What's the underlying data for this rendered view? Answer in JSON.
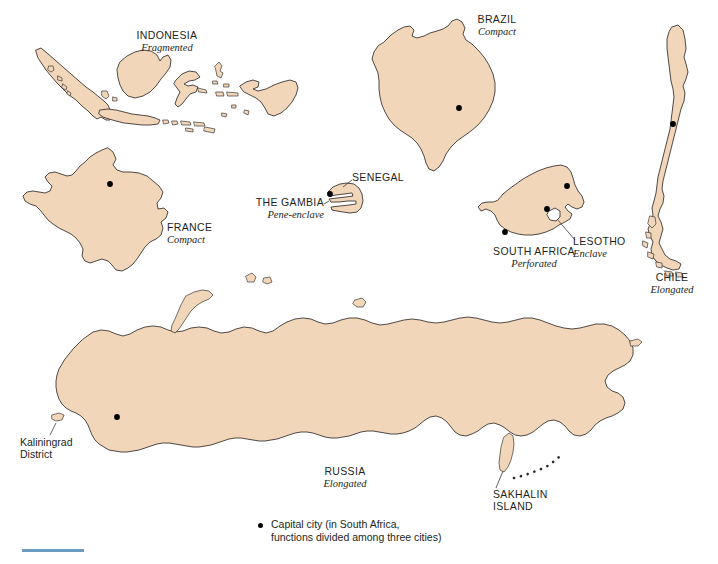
{
  "figure": {
    "background_color": "#ffffff",
    "land_fill_color": "#f2d6b9",
    "land_outline_color": "#3c3733",
    "capital_dot_color": "#000000",
    "rule_color": "#6c9cc4"
  },
  "labels": {
    "indonesia": {
      "name": "INDONESIA",
      "type": "Fragmented"
    },
    "brazil": {
      "name": "BRAZIL",
      "type": "Compact"
    },
    "france": {
      "name": "FRANCE",
      "type": "Compact"
    },
    "senegal": {
      "name": "SENEGAL",
      "type": ""
    },
    "gambia": {
      "name": "THE GAMBIA",
      "type": "Pene-enclave"
    },
    "south_africa": {
      "name": "SOUTH AFRICA",
      "type": "Perforated"
    },
    "lesotho": {
      "name": "LESOTHO",
      "type": "Enclave"
    },
    "chile": {
      "name": "CHILE",
      "type": "Elongated"
    },
    "russia": {
      "name": "RUSSIA",
      "type": "Elongated"
    },
    "kaliningrad": {
      "line1": "Kaliningrad",
      "line2": "District"
    },
    "sakhalin": {
      "line1": "SAKHALIN",
      "line2": "ISLAND"
    }
  },
  "legend": {
    "symbol": "capital-city-dot",
    "line1": "Capital city (in South Africa,",
    "line2": "functions divided among three cities)"
  },
  "map_features": {
    "countries": [
      {
        "id": "indonesia",
        "morphology": "Fragmented",
        "capital_count": 1
      },
      {
        "id": "france",
        "morphology": "Compact",
        "capital_count": 1
      },
      {
        "id": "brazil",
        "morphology": "Compact",
        "capital_count": 1
      },
      {
        "id": "senegal",
        "morphology": "Pene-enclave host",
        "capital_count": 1
      },
      {
        "id": "south-africa",
        "morphology": "Perforated",
        "capital_count": 3
      },
      {
        "id": "chile",
        "morphology": "Elongated",
        "capital_count": 1
      },
      {
        "id": "russia",
        "morphology": "Elongated",
        "capital_count": 1
      }
    ]
  }
}
